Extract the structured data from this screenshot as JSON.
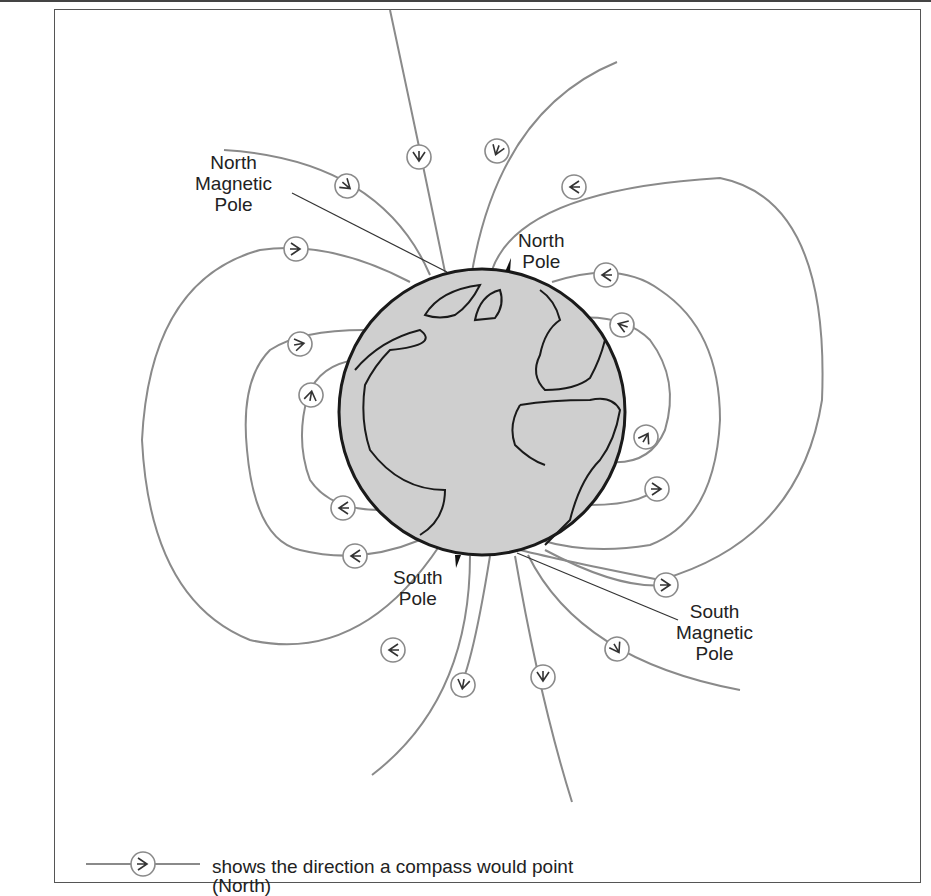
{
  "diagram": {
    "labels": {
      "north_magnetic_pole": [
        "North",
        "Magnetic",
        "Pole"
      ],
      "north_pole": [
        "North",
        "Pole"
      ],
      "south_pole": [
        "South",
        "Pole"
      ],
      "south_magnetic_pole": [
        "South",
        "Magnetic",
        "Pole"
      ]
    },
    "legend": {
      "symbol": "compass-arrow-circle",
      "line1": "shows the direction a compass would point",
      "line2": "(North)"
    },
    "colors": {
      "field_line": "#8a8a8a",
      "earth_fill": "#cfcfcf",
      "outline": "#1a1a1a",
      "text": "#222222"
    }
  }
}
